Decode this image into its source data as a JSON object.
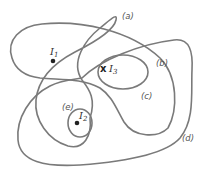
{
  "diagram": {
    "regions": [
      {
        "id": "a",
        "label": "(a)"
      },
      {
        "id": "b",
        "label": "(b)"
      },
      {
        "id": "c",
        "label": "(c)"
      },
      {
        "id": "d",
        "label": "(d)"
      },
      {
        "id": "e",
        "label": "(e)"
      }
    ],
    "points": [
      {
        "id": "I1",
        "base": "I",
        "sub": "1",
        "marker": "dot"
      },
      {
        "id": "I2",
        "base": "I",
        "sub": "2",
        "marker": "dot"
      },
      {
        "id": "I3",
        "base": "I",
        "sub": "3",
        "marker": "x",
        "marker_text": "x"
      }
    ],
    "colors": {
      "stroke": "#7a7a7a",
      "label": "#555555",
      "point": "#222222"
    }
  }
}
